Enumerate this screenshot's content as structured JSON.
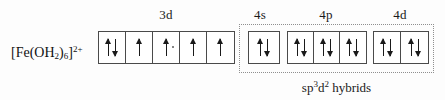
{
  "diagram": {
    "species": {
      "prefix": "[Fe(OH",
      "sub_h2o": "2",
      "mid": ")",
      "sub_six": "6",
      "suffix": "]",
      "charge": "2+",
      "plain": "[Fe(OH2)6]2+"
    },
    "shell_labels": {
      "three_d": "3d",
      "four_s": "4s",
      "four_p": "4p",
      "four_d": "4d"
    },
    "hybrid_caption": {
      "base": "sp",
      "sup1": "3",
      "mid": "d",
      "sup2": "2",
      "tail": " hybrids",
      "plain": "sp3d2 hybrids"
    },
    "colors": {
      "box_border": "#4a4a4a",
      "arrow": "#1a1a1a",
      "dotted_region": "#8f8f8f",
      "background": "#fdfdfd",
      "text": "#111111"
    },
    "orbitals": [
      {
        "name": "3d",
        "label": "3d",
        "in_hybrid_region": false,
        "boxes": [
          {
            "name": "3d-box-1",
            "electrons": [
              "up",
              "down"
            ],
            "occupancy": 2
          },
          {
            "name": "3d-box-2",
            "electrons": [
              "up"
            ],
            "occupancy": 1
          },
          {
            "name": "3d-box-3",
            "electrons": [
              "up"
            ],
            "occupancy": 1,
            "speck": true
          },
          {
            "name": "3d-box-4",
            "electrons": [
              "up"
            ],
            "occupancy": 1
          },
          {
            "name": "3d-box-5",
            "electrons": [
              "up"
            ],
            "occupancy": 1
          }
        ]
      },
      {
        "name": "4s",
        "label": "4s",
        "in_hybrid_region": true,
        "boxes": [
          {
            "name": "4s-box-1",
            "electrons": [
              "up",
              "down"
            ],
            "occupancy": 2
          }
        ]
      },
      {
        "name": "4p",
        "label": "4p",
        "in_hybrid_region": true,
        "boxes": [
          {
            "name": "4p-box-1",
            "electrons": [
              "up",
              "down"
            ],
            "occupancy": 2
          },
          {
            "name": "4p-box-2",
            "electrons": [
              "up",
              "down"
            ],
            "occupancy": 2
          },
          {
            "name": "4p-box-3",
            "electrons": [
              "up",
              "down"
            ],
            "occupancy": 2
          }
        ]
      },
      {
        "name": "4d",
        "label": "4d",
        "in_hybrid_region": true,
        "boxes": [
          {
            "name": "4d-box-1",
            "electrons": [
              "up",
              "down"
            ],
            "occupancy": 2
          },
          {
            "name": "4d-box-2",
            "electrons": [
              "up",
              "down"
            ],
            "occupancy": 2
          }
        ]
      }
    ]
  }
}
